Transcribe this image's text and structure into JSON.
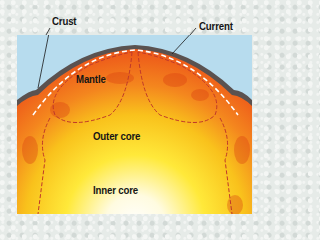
{
  "diagram": {
    "labels": {
      "crust": "Crust",
      "current": "Current",
      "mantle": "Mantle",
      "outer_core": "Outer core",
      "inner_core": "Inner core"
    },
    "colors": {
      "sky": "#b7dcee",
      "crust": "#5a5250",
      "mantle": "#f06a1e",
      "outer_core": "#f7c51c",
      "inner_core": "#ffffff",
      "current_line": "#c0382a"
    }
  }
}
